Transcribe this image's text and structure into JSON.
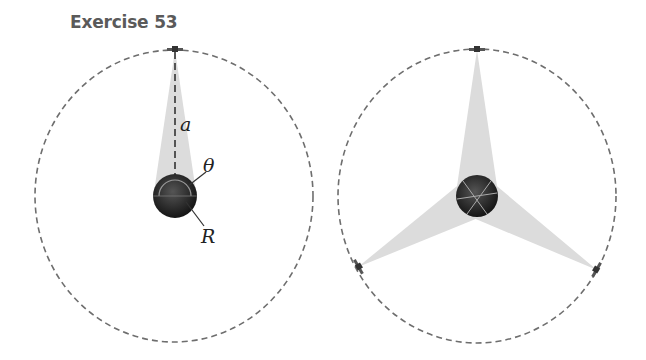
{
  "title": "Exercise 53",
  "left_figure": {
    "orbit": {
      "cx": 174,
      "cy": 196,
      "rx": 139,
      "ry": 146
    },
    "planet": {
      "cx": 175,
      "cy": 196,
      "r": 22
    },
    "satellite": {
      "x": 175,
      "y": 50
    },
    "labels": {
      "a": "a",
      "theta": "θ",
      "R": "R"
    }
  },
  "right_figure": {
    "orbit": {
      "cx": 477,
      "cy": 196,
      "rx": 139,
      "ry": 147
    },
    "planet": {
      "cx": 477,
      "cy": 196,
      "r": 21
    },
    "satellites": [
      {
        "x": 477,
        "y": 50
      },
      {
        "x": 358,
        "y": 267
      },
      {
        "x": 597,
        "y": 270
      }
    ]
  },
  "colors": {
    "orbit": "#6e6e6e",
    "cone": "#dcdcdc",
    "planet": "#2b2b2b",
    "title": "#5a5a5a"
  }
}
